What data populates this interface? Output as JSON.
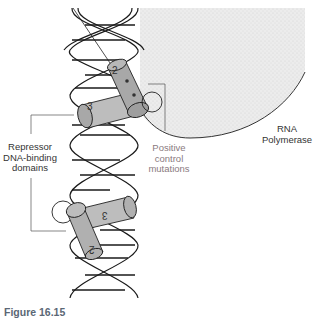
{
  "figure": {
    "caption": "Figure 16.15",
    "labels": {
      "rna_polymerase_line1": "RNA",
      "rna_polymerase_line2": "Polymerase",
      "repressor_line1": "Repressor",
      "repressor_line2": "DNA-binding",
      "repressor_line3": "domains",
      "positive_line1": "Positive",
      "positive_line2": "control",
      "positive_line3": "mutations"
    },
    "helix_labels": {
      "upper_helix_2": "2",
      "upper_helix_3": "3",
      "lower_helix_2": "2",
      "lower_helix_3": "3"
    },
    "colors": {
      "polymerase_fill": "#e6e6e6",
      "helix_fill": "#bdbdbd",
      "helix_dark": "#9e9e9e",
      "dna_stroke": "#1a1a1a",
      "caption": "#5b6775",
      "leader_line": "#555555"
    }
  }
}
